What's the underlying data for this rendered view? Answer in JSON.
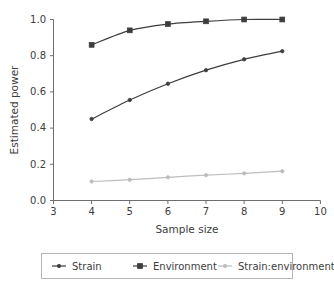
{
  "chart_data": {
    "type": "line",
    "title": "",
    "xlabel": "Sample size",
    "ylabel": "Estimated power",
    "x": [
      4,
      5,
      6,
      7,
      8,
      9
    ],
    "xlim": [
      3,
      10
    ],
    "ylim": [
      0.0,
      1.0
    ],
    "xticks": [
      3,
      4,
      5,
      6,
      7,
      8,
      9,
      10
    ],
    "xtick_labels": [
      "3",
      "4",
      "5",
      "6",
      "7",
      "8",
      "9",
      "10"
    ],
    "yticks": [
      0.0,
      0.2,
      0.4,
      0.6,
      0.8,
      1.0
    ],
    "ytick_labels": [
      "0.0",
      "0.2",
      "0.4",
      "0.6",
      "0.8",
      "1.0"
    ],
    "grid": false,
    "legend_position": "below",
    "series": [
      {
        "name": "Strain",
        "values": [
          0.45,
          0.555,
          0.645,
          0.72,
          0.78,
          0.825
        ],
        "color": "#3d3d3d",
        "marker": "dot"
      },
      {
        "name": "Environment",
        "values": [
          0.86,
          0.94,
          0.975,
          0.99,
          1.0,
          1.0
        ],
        "color": "#3d3d3d",
        "marker": "square"
      },
      {
        "name": "Strain:environment",
        "values": [
          0.105,
          0.115,
          0.128,
          0.14,
          0.15,
          0.162
        ],
        "color": "#bdbdbd",
        "marker": "dot"
      }
    ]
  },
  "axes": {
    "xlabel": "Sample size",
    "ylabel": "Estimated power"
  },
  "legend": {
    "items": [
      {
        "label": "Strain"
      },
      {
        "label": "Environment"
      },
      {
        "label": "Strain:environment"
      }
    ]
  },
  "ticks": {
    "x": [
      "3",
      "4",
      "5",
      "6",
      "7",
      "8",
      "9",
      "10"
    ],
    "y": [
      "0.0",
      "0.2",
      "0.4",
      "0.6",
      "0.8",
      "1.0"
    ]
  }
}
